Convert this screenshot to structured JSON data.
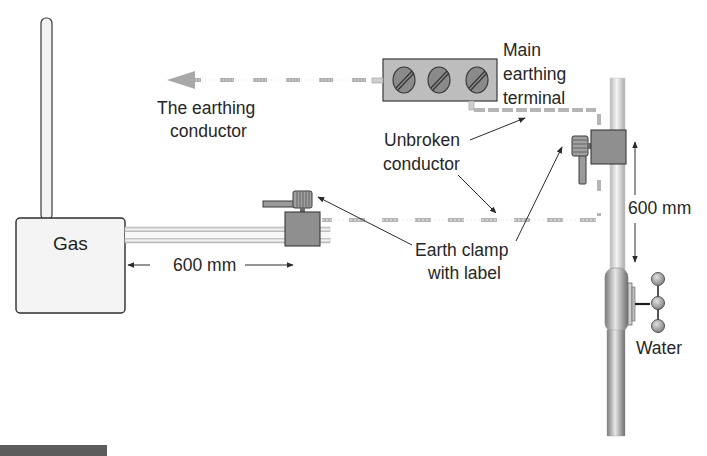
{
  "diagram": {
    "labels": {
      "gas": "Gas",
      "water": "Water",
      "earthing_conductor": [
        "The earthing",
        "conductor"
      ],
      "main_earthing_terminal": [
        "Main",
        "earthing",
        "terminal"
      ],
      "unbroken_conductor": [
        "Unbroken",
        "conductor"
      ],
      "earth_clamp": [
        "Earth clamp",
        "with label"
      ],
      "gas_distance": "600 mm",
      "water_distance": "600 mm"
    },
    "components": [
      {
        "id": "gas-meter",
        "label": "Gas"
      },
      {
        "id": "main-earthing-terminal",
        "screws": 3
      },
      {
        "id": "gas-earth-clamp"
      },
      {
        "id": "water-earth-clamp"
      },
      {
        "id": "water-stop-tap",
        "label": "Water"
      }
    ],
    "colors": {
      "conductor_dash": "#b5b5b5",
      "clamp_body": "#8f8f8f",
      "terminal_body": "#bdbdbd",
      "screw": "#8a8a8a",
      "pipe": "#d9d9d9",
      "outline": "#3a3a3a",
      "text": "#262626"
    }
  }
}
